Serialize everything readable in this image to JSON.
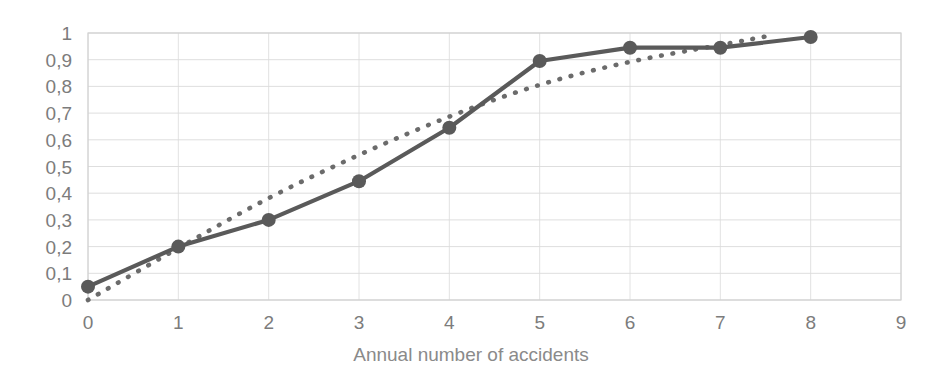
{
  "chart_data": {
    "type": "line",
    "title": "",
    "xlabel": "Annual number of accidents",
    "ylabel": "",
    "xlim": [
      0,
      9
    ],
    "ylim": [
      0,
      1
    ],
    "grid": true,
    "legend": "none",
    "x_tick_labels": [
      "0",
      "1",
      "2",
      "3",
      "4",
      "5",
      "6",
      "7",
      "8",
      "9"
    ],
    "y_tick_labels": [
      "0",
      "0,1",
      "0,2",
      "0,3",
      "0,4",
      "0,5",
      "0,6",
      "0,7",
      "0,8",
      "0,9",
      "1"
    ],
    "x": [
      0,
      1,
      2,
      3,
      4,
      5,
      6,
      7,
      8
    ],
    "series": [
      {
        "name": "empirical-cumulative",
        "style": "solid-with-markers",
        "color": "#5a5a5a",
        "values": [
          0.05,
          0.2,
          0.3,
          0.445,
          0.645,
          0.895,
          0.945,
          0.945,
          0.985
        ]
      },
      {
        "name": "fitted-cumulative",
        "style": "dotted",
        "color": "#6b6b6b",
        "x": [
          0,
          1,
          2,
          3,
          4,
          5,
          6,
          7,
          7.55
        ],
        "values": [
          0.0,
          0.195,
          0.385,
          0.545,
          0.69,
          0.81,
          0.895,
          0.955,
          0.99
        ]
      }
    ]
  },
  "axis": {
    "x_title": "Annual number of accidents"
  },
  "colors": {
    "series": "#5a5a5a",
    "dotted_series": "#6b6b6b",
    "grid": "#d9d9d9",
    "tick_label": "#7c7c7c",
    "axis_title": "#8a8a8a",
    "background": "#ffffff"
  }
}
